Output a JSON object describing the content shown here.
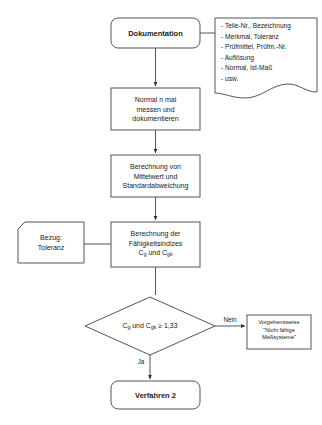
{
  "diagram": {
    "background_color": "#ffffff",
    "stroke_color": "#4d4d4d",
    "text_color": "#1a1a1a"
  },
  "nodes": {
    "dokumentation": {
      "label": "Dokumentation",
      "shape": "rounded-rect",
      "x": 111,
      "y": 18,
      "w": 89,
      "h": 30
    },
    "messen": {
      "label": "Normal n mal\nmessen und\ndokumentieren",
      "shape": "rect",
      "x": 111,
      "y": 88,
      "w": 89,
      "h": 42
    },
    "berechnung_mittelwert": {
      "label": "Berechnung von\nMittelwert und\nStandardabweichung",
      "shape": "rect",
      "x": 111,
      "y": 155,
      "w": 89,
      "h": 42
    },
    "bezug_toleranz": {
      "label": "Bezug:\nToleranz",
      "shape": "cut-corner-rect",
      "x": 18,
      "y": 222,
      "w": 66,
      "h": 41
    },
    "berechnung_faehigkeit": {
      "label_line1": "Berechnung der",
      "label_line2": "Fähigkeitsindizes",
      "label_line3_prefix": "C",
      "label_line3_sub1": "g",
      "label_line3_mid": " und C",
      "label_line3_sub2": "gk",
      "shape": "rect",
      "x": 111,
      "y": 222,
      "w": 89,
      "h": 45
    },
    "entscheidung": {
      "label_prefix": "C",
      "label_sub1": "g",
      "label_mid": " und C",
      "label_sub2": "gk",
      "label_suffix": " ≥ 1,33",
      "shape": "diamond",
      "x": 85,
      "y": 297,
      "w": 130,
      "h": 58
    },
    "nicht_faehig": {
      "label": "Vorgehensweise\n\"Nicht fähige\nMeßsysteme\"",
      "shape": "rect",
      "x": 247,
      "y": 315,
      "w": 64,
      "h": 34
    },
    "verfahren2": {
      "label": "Verfahren 2",
      "shape": "rounded-rect",
      "x": 111,
      "y": 381,
      "w": 89,
      "h": 28
    },
    "dokument_annotation": {
      "items": "- Teile-Nr., Bezeichnung\n- Merkmal, Toleranz\n- Prüfmittel, Prüfm.-Nr.\n- Auflösung\n- Normal, Ist-Maß\n- usw.",
      "shape": "document-wavy",
      "x": 215,
      "y": 18,
      "w": 102,
      "h": 82
    }
  },
  "edges": {
    "nein_label": "Nein",
    "ja_label": "Ja"
  }
}
